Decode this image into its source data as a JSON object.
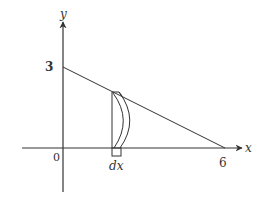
{
  "figure": {
    "type": "volume-by-slicing sketch",
    "axes": {
      "x_label": "x",
      "y_label": "y",
      "origin_label": "0"
    },
    "ticks": {
      "y_intercept_label": "3",
      "x_intercept_label": "6"
    },
    "strip": {
      "width_label": "dx"
    },
    "line": {
      "from": [
        0,
        3
      ],
      "to": [
        6,
        0
      ]
    },
    "colors": {
      "stroke": "#333333",
      "background": "#ffffff"
    }
  }
}
